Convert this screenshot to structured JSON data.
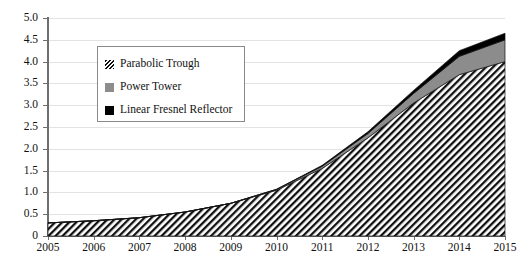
{
  "chart_data": {
    "type": "area",
    "stacked": true,
    "title": "",
    "subtitle": "",
    "xlabel": "",
    "ylabel": "",
    "categories": [
      "2005",
      "2006",
      "2007",
      "2008",
      "2009",
      "2010",
      "2011",
      "2012",
      "2013",
      "2014",
      "2015"
    ],
    "x": [
      2005,
      2006,
      2007,
      2008,
      2009,
      2010,
      2011,
      2012,
      2013,
      2014,
      2015
    ],
    "xlim": [
      2005,
      2015
    ],
    "ylim": [
      0,
      5.0
    ],
    "ytick_labels": [
      "0",
      "0.5",
      "1.0",
      "1.5",
      "2.0",
      "2.5",
      "3.0",
      "3.5",
      "4.0",
      "4.5",
      "5.0"
    ],
    "ytick_values": [
      0,
      0.5,
      1.0,
      1.5,
      2.0,
      2.5,
      3.0,
      3.5,
      4.0,
      4.5,
      5.0
    ],
    "xtick_labels": [
      "2005",
      "2006",
      "2007",
      "2008",
      "2009",
      "2010",
      "2011",
      "2012",
      "2013",
      "2014",
      "2015"
    ],
    "grid": true,
    "grid_axis": "y",
    "legend_position": "upper-left-inset",
    "series": [
      {
        "name": "Parabolic Trough",
        "fill": "hatch-diagonal",
        "color": "#111111",
        "values": [
          0.3,
          0.35,
          0.42,
          0.55,
          0.75,
          1.05,
          1.55,
          2.25,
          3.05,
          3.7,
          4.0
        ]
      },
      {
        "name": "Power Tower",
        "fill": "solid",
        "color": "#8c8c8c",
        "values": [
          0.0,
          0.0,
          0.0,
          0.0,
          0.0,
          0.02,
          0.05,
          0.1,
          0.22,
          0.42,
          0.5
        ]
      },
      {
        "name": "Linear Fresnel Reflector",
        "fill": "solid",
        "color": "#000000",
        "values": [
          0.0,
          0.0,
          0.0,
          0.0,
          0.0,
          0.0,
          0.02,
          0.04,
          0.07,
          0.13,
          0.15
        ]
      }
    ],
    "totals": [
      0.3,
      0.35,
      0.42,
      0.55,
      0.75,
      1.07,
      1.62,
      2.39,
      3.34,
      4.25,
      4.65
    ]
  },
  "legend": {
    "items": [
      {
        "label": "Parabolic Trough",
        "swatch": "hatch-swatch-icon"
      },
      {
        "label": "Power Tower",
        "swatch": "gray-square-swatch-icon"
      },
      {
        "label": "Linear Fresnel Reflector",
        "swatch": "black-square-swatch-icon"
      }
    ]
  },
  "colors": {
    "axis": "#6e6e6e",
    "grid": "#e3e3e3",
    "text": "#111111",
    "power_tower": "#8c8c8c",
    "linear_fresnel": "#000000",
    "background": "#ffffff"
  }
}
